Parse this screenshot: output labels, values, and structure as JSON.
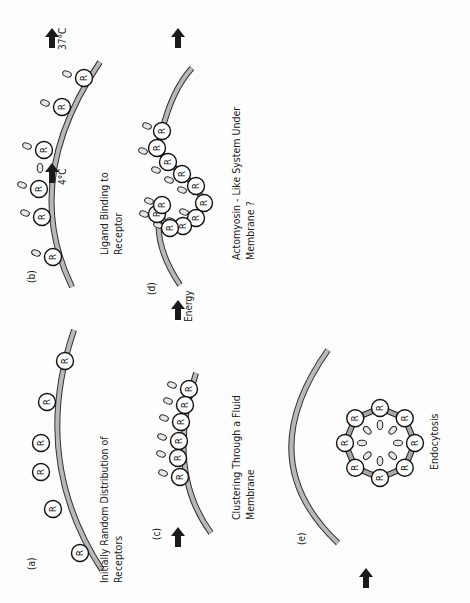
{
  "colors": {
    "membrane_fill": "#b8b8b8",
    "membrane_edge": "#333333",
    "receptor_fill": "#ffffff",
    "receptor_edge": "#111111",
    "ligand_fill": "#e6e6e6",
    "arrow": "#1a1a1a",
    "text": "#222222",
    "link": "#a8a8a8"
  },
  "receptor_letter": "R",
  "panels": [
    {
      "id": "a",
      "label": "(a)",
      "label_pos": [
        35,
        570
      ],
      "caption": [
        "Initially  Random  Distribution  of",
        "Receptors"
      ],
      "caption_pos": [
        108,
        583
      ],
      "membrane": "M 102 570 Q 30 460 74 330",
      "receptors": [
        [
          65,
          361
        ],
        [
          47,
          402
        ],
        [
          41,
          443
        ],
        [
          41,
          472
        ],
        [
          53,
          509
        ],
        [
          80,
          553
        ]
      ],
      "ligands": [],
      "arrow": null
    },
    {
      "id": "b",
      "label": "(b)",
      "label_pos": [
        35,
        283
      ],
      "caption": [
        "Ligand  Binding  to",
        "Receptor"
      ],
      "caption_pos": [
        108,
        255
      ],
      "membrane": "M 72 287 Q 20 180 100 62",
      "receptors": [
        [
          53,
          257
        ],
        [
          42,
          217
        ],
        [
          39,
          189
        ],
        [
          44,
          150
        ],
        [
          62,
          107
        ],
        [
          84,
          78
        ]
      ],
      "ligands": [
        [
          -17,
          -4
        ],
        [
          -17,
          -4
        ],
        [
          -17,
          -4
        ],
        [
          -17,
          -4
        ],
        [
          -17,
          -4
        ],
        [
          -17,
          -4
        ]
      ],
      "arrow": {
        "pos": [
          52,
          163
        ],
        "text": "4°C",
        "extra_ligand": true
      }
    },
    {
      "id": "c",
      "label": "(c)",
      "label_pos": [
        160,
        540
      ],
      "caption": [
        "Clustering  Through  a  Fluid",
        "Membrane"
      ],
      "caption_pos": [
        240,
        520
      ],
      "membrane": "M 211 533 Q 165 470 196 373",
      "receptors": [
        [
          189,
          389
        ],
        [
          185,
          405
        ],
        [
          181,
          422
        ],
        [
          179,
          441
        ],
        [
          178,
          458
        ],
        [
          180,
          477
        ]
      ],
      "ligands": [
        [
          -17,
          -4
        ],
        [
          -17,
          -4
        ],
        [
          -17,
          -4
        ],
        [
          -17,
          -4
        ],
        [
          -17,
          -4
        ],
        [
          -17,
          -4
        ]
      ],
      "arrow": {
        "pos": [
          178,
          527
        ],
        "text": ""
      }
    },
    {
      "id": "d",
      "label": "(d)",
      "label_pos": [
        155,
        295
      ],
      "caption": [
        "Actomyosin - Like  System  Under",
        "Membrane ?"
      ],
      "caption_pos": [
        240,
        260
      ],
      "membrane": "M 180 285 Q 150 240 162 205 M 162 131 Q 172 90 192 68",
      "receptors": [
        [
          162,
          131
        ],
        [
          157,
          148
        ],
        [
          168,
          162
        ],
        [
          182,
          174
        ],
        [
          196,
          186
        ],
        [
          204,
          203
        ],
        [
          196,
          218
        ],
        [
          183,
          226
        ],
        [
          170,
          228
        ],
        [
          157,
          214
        ],
        [
          162,
          205
        ]
      ],
      "ligands": [
        [
          -15,
          -5
        ],
        [
          -14,
          3
        ],
        [
          -12,
          8
        ],
        [
          -13,
          6
        ],
        [
          -14,
          4
        ],
        [
          0,
          0
        ],
        [
          -12,
          -6
        ],
        [
          -12,
          -5
        ],
        [
          -12,
          -3
        ],
        [
          -13,
          0
        ],
        [
          -13,
          -4
        ]
      ],
      "arrow": {
        "pos": [
          178,
          300
        ],
        "text": "Energy"
      }
    },
    {
      "id": "e",
      "label": "(e)",
      "label_pos": [
        305,
        545
      ],
      "caption": [
        "Endocytosis"
      ],
      "caption_pos": [
        438,
        470
      ],
      "membrane": "M 338 543 Q 250 460 328 350",
      "receptors": [],
      "ligands": [],
      "arrow": {
        "pos": [
          366,
          568
        ],
        "text": ""
      }
    }
  ],
  "endocytosis_ring": {
    "center": [
      380,
      443
    ],
    "radius": 35,
    "count": 8
  },
  "top_arrow": {
    "pos": [
      52,
      28
    ],
    "text": "37°C"
  },
  "right_arrow": {
    "pos": [
      178,
      28
    ],
    "text": ""
  }
}
